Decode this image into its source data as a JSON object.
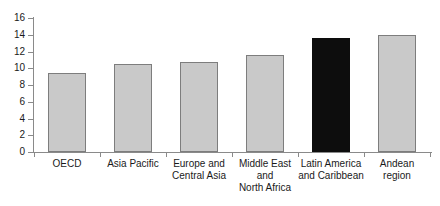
{
  "chart_data": {
    "type": "bar",
    "title": "",
    "subtitle": "",
    "xlabel": "",
    "ylabel": "",
    "ylim": [
      0,
      16
    ],
    "ytick_step": 2,
    "yticks": [
      "0",
      "2",
      "4",
      "6",
      "8",
      "10",
      "12",
      "14",
      "16"
    ],
    "grid": false,
    "legend": null,
    "categories": [
      "OECD",
      "Asia Pacific",
      "Europe and\nCentral Asia",
      "Middle East\nand\nNorth Africa",
      "Latin America\nand Caribbean",
      "Andean\nregion"
    ],
    "values": [
      9.4,
      10.5,
      10.7,
      11.6,
      13.6,
      14.0
    ],
    "bar_colors": [
      "#c9c9c9",
      "#c9c9c9",
      "#c9c9c9",
      "#c9c9c9",
      "#0d0d0d",
      "#c9c9c9"
    ],
    "highlight_index": 4,
    "colors": {
      "bar_fill": "#c9c9c9",
      "bar_edge": "#7d7d7d",
      "highlight_fill": "#0d0d0d",
      "axis": "#8a8a8a",
      "text": "#1a1a1a",
      "background": "#ffffff"
    }
  }
}
